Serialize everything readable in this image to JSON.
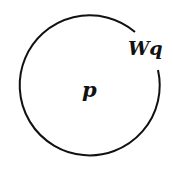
{
  "diagram": {
    "type": "circle-with-gap",
    "labels": {
      "center": "p",
      "gap": "Wq"
    },
    "stroke_color": "#111111",
    "background": "#ffffff"
  }
}
